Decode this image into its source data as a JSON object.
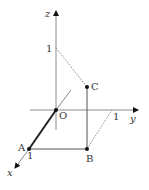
{
  "diagram": {
    "type": "3d-coordinate-axes",
    "colors": {
      "axis": "#8a8a8a",
      "edge": "#555555",
      "thick_edge": "#222222",
      "dotted": "#888888",
      "point": "#111111",
      "text": "#333333"
    },
    "axes": {
      "x": {
        "label": "x",
        "tick_label": "1"
      },
      "y": {
        "label": "y",
        "tick_label": "1"
      },
      "z": {
        "label": "z",
        "tick_label": "1"
      }
    },
    "origin": {
      "label": "O"
    },
    "points": [
      {
        "id": "A",
        "label": "A",
        "coords": "(1, 0, 0)"
      },
      {
        "id": "B",
        "label": "B",
        "coords": "(1, 1, 0)"
      },
      {
        "id": "C",
        "label": "C",
        "coords": "(1, 1, h)"
      }
    ],
    "segments": [
      {
        "from": "O",
        "to": "A",
        "style": "thick"
      },
      {
        "from": "A",
        "to": "B",
        "style": "solid"
      },
      {
        "from": "B",
        "to": "C",
        "style": "solid"
      },
      {
        "from": "z=1",
        "to": "C",
        "style": "dotted"
      },
      {
        "from": "B",
        "to": "y=1",
        "style": "dotted"
      }
    ]
  }
}
